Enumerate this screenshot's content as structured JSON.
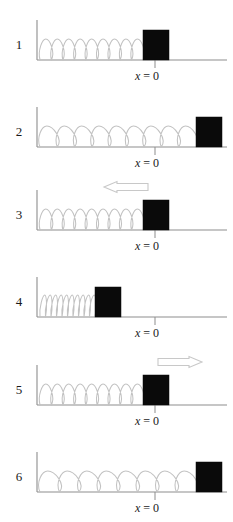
{
  "figure": {
    "type": "physics-diagram",
    "panel_count": 6,
    "colors": {
      "block": "#0a0a0a",
      "spring": "#c2c2c2",
      "axis": "#8d8d8d",
      "arrow_outline": "#c8c8c8",
      "arrow_fill": "#ffffff",
      "text": "#1a1a1a",
      "background": "#ffffff"
    },
    "geometry": {
      "wall_x": 37,
      "ground_right_x": 227,
      "equilibrium_tick_x": 155,
      "block_width": 26,
      "block_height": 30
    }
  },
  "axis_label": {
    "variable": "x",
    "equals": " = ",
    "value": "0",
    "full": "x = 0"
  },
  "panels": [
    {
      "number": "1",
      "state": "equilibrium",
      "block_left": 143,
      "block_at_origin": true,
      "spring_start": 40,
      "spring_end": 143,
      "coils": 9,
      "coil_style": "relaxed",
      "arrow": null,
      "show_x_label": true
    },
    {
      "number": "2",
      "state": "stretched-right",
      "block_left": 196,
      "block_at_origin": false,
      "spring_start": 40,
      "spring_end": 196,
      "coils": 9,
      "coil_style": "stretched",
      "arrow": null,
      "show_x_label": true
    },
    {
      "number": "3",
      "state": "moving-left",
      "block_left": 143,
      "block_at_origin": true,
      "spring_start": 40,
      "spring_end": 143,
      "coils": 9,
      "coil_style": "relaxed",
      "arrow": {
        "direction": "left",
        "name": "velocity-arrow-left",
        "x": 104,
        "y": 13,
        "length": 44,
        "label": ""
      },
      "show_x_label": true
    },
    {
      "number": "4",
      "state": "compressed",
      "block_left": 95,
      "block_at_origin": false,
      "spring_start": 40,
      "spring_end": 95,
      "coils": 10,
      "coil_style": "compressed",
      "arrow": null,
      "show_x_label": true
    },
    {
      "number": "5",
      "state": "moving-right",
      "block_left": 143,
      "block_at_origin": true,
      "spring_start": 40,
      "spring_end": 143,
      "coils": 9,
      "coil_style": "relaxed",
      "arrow": {
        "direction": "right",
        "name": "velocity-arrow-right",
        "x": 158,
        "y": 13,
        "length": 44,
        "label": ""
      },
      "show_x_label": true
    },
    {
      "number": "6",
      "state": "stretched-right",
      "block_left": 196,
      "block_at_origin": false,
      "spring_start": 40,
      "spring_end": 196,
      "coils": 8,
      "coil_style": "stretched",
      "arrow": null,
      "show_x_label": true
    }
  ]
}
